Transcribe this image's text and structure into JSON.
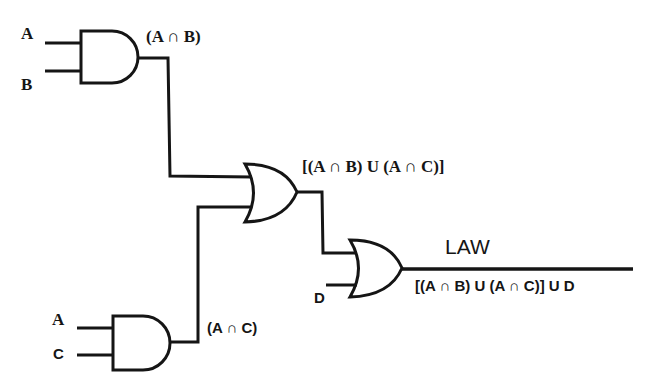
{
  "diagram": {
    "type": "logic-circuit",
    "inputs": {
      "and1_a": "A",
      "and1_b": "B",
      "and2_a": "A",
      "and2_c": "C",
      "or2_d": "D"
    },
    "gates": [
      {
        "id": "and1",
        "kind": "AND",
        "inputs": [
          "A",
          "B"
        ],
        "output_label": "(A ∩ B)"
      },
      {
        "id": "and2",
        "kind": "AND",
        "inputs": [
          "A",
          "C"
        ],
        "output_label": "(A ∩ C)"
      },
      {
        "id": "or1",
        "kind": "OR",
        "inputs": [
          "(A ∩ B)",
          "(A ∩ C)"
        ],
        "output_label": "[(A ∩ B) U (A ∩ C)]"
      },
      {
        "id": "or2",
        "kind": "OR",
        "inputs": [
          "[(A ∩ B) U (A ∩ C)]",
          "D"
        ],
        "output_label": "[(A ∩ B) U (A ∩ C)] U D"
      }
    ],
    "output_title": "LAW",
    "stroke_color": "#151515",
    "background": "#ffffff"
  }
}
